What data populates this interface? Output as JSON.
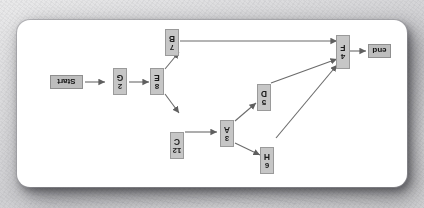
{
  "canvas": {
    "width": 424,
    "height": 208,
    "background_color": "#d8d8da",
    "card": {
      "background_color": "#ffffff",
      "border_radius_px": 13,
      "rotation_degrees": 180
    }
  },
  "diagram": {
    "type": "directed-graph",
    "orientation_note": "rendered upside down (180 degrees)",
    "node_fill_color": "#c6c6c6",
    "node_border_color": "#9a9a9a",
    "edge_color": "#6b6b6b",
    "terminals": [
      {
        "id": "start",
        "label": "Start"
      },
      {
        "id": "end",
        "label": "end"
      }
    ],
    "nodes": [
      {
        "id": "H",
        "letter": "H",
        "value": "6"
      },
      {
        "id": "A",
        "letter": "A",
        "value": "3"
      },
      {
        "id": "C",
        "letter": "C",
        "value": "12"
      },
      {
        "id": "D",
        "letter": "D",
        "value": "5"
      },
      {
        "id": "E",
        "letter": "E",
        "value": "8"
      },
      {
        "id": "G",
        "letter": "G",
        "value": "2"
      },
      {
        "id": "B",
        "letter": "B",
        "value": "7"
      },
      {
        "id": "F",
        "letter": "F",
        "value": "4"
      }
    ],
    "edges": [
      {
        "from": "start",
        "to": "G"
      },
      {
        "from": "G",
        "to": "E"
      },
      {
        "from": "E",
        "to": "C"
      },
      {
        "from": "E",
        "to": "B"
      },
      {
        "from": "C",
        "to": "A"
      },
      {
        "from": "A",
        "to": "H"
      },
      {
        "from": "A",
        "to": "D"
      },
      {
        "from": "H",
        "to": "F"
      },
      {
        "from": "D",
        "to": "F"
      },
      {
        "from": "B",
        "to": "F"
      },
      {
        "from": "F",
        "to": "end"
      }
    ]
  }
}
